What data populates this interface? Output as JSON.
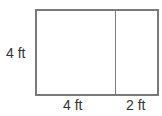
{
  "diagram": {
    "type": "rectangle-area-model",
    "labels": {
      "height": "4 ft",
      "width_part1": "4 ft",
      "width_part2": "2 ft"
    },
    "colors": {
      "stroke": "#7a7a7a",
      "text": "#333333",
      "fill": "#ffffff"
    }
  }
}
